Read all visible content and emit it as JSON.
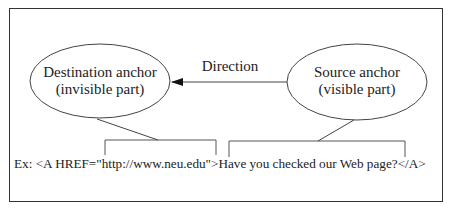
{
  "diagram": {
    "destination_anchor": {
      "line1": "Destination anchor",
      "line2": "(invisible part)"
    },
    "source_anchor": {
      "line1": "Source anchor",
      "line2": "(visible part)"
    },
    "direction_label": "Direction",
    "example": {
      "prefix": "Ex: ",
      "tag_open": "<A HREF=\"http://www.neu.edu\">",
      "link_text": "Have you checked our Web page?",
      "tag_close": "</A>"
    },
    "colors": {
      "stroke": "#333333",
      "background": "#ffffff",
      "text": "#222222"
    }
  }
}
